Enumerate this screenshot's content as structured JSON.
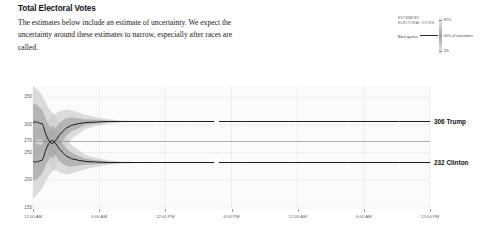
{
  "header": {
    "title": "Total Electoral Votes",
    "description": "The estimates below include an estimate of uncertainty. We expect the uncertainty around these estimates to narrow, especially after races are called."
  },
  "legend": {
    "title": "ESTIMATED ELECTORAL VOTES",
    "best_guess_label": "Best guess",
    "ticks": {
      "high": "95%",
      "middle": "50% of outcomes",
      "low": "5%"
    }
  },
  "annotations": {
    "trump": "306 Trump",
    "clinton": "232 Clinton"
  },
  "chart_data": {
    "type": "line",
    "title": "Total Electoral Votes",
    "xlabel": "",
    "ylabel": "Electoral votes",
    "ylim": [
      150,
      370
    ],
    "yticks": [
      350,
      300,
      270,
      250,
      200,
      150
    ],
    "ytick_labels": [
      "350",
      "300",
      "270",
      "250",
      "200",
      "150"
    ],
    "xticks": [
      "12:00 AM",
      "6:00 AM",
      "12:00 PM",
      "6:00 PM",
      "12:00 AM",
      "6:00 AM",
      "12:00 PM"
    ],
    "grid": true,
    "threshold": 270,
    "threshold_label": "270 to win",
    "legend_position": "top-right",
    "colors": {
      "line": "#1c1c1c",
      "band_inner": "#a9a9a9",
      "band_outer": "#cfcfcf",
      "threshold_line": "#8f8f8f",
      "grid": "#e8e8e8"
    },
    "series": [
      {
        "name": "306 Trump",
        "final_value": 306,
        "x": [
          0,
          2,
          4,
          6,
          8,
          10,
          12,
          14,
          16,
          18,
          20,
          22,
          24,
          26,
          28,
          30,
          34,
          38,
          44,
          52,
          60,
          72,
          86,
          100,
          140,
          180,
          240,
          300,
          360,
          420,
          455
        ],
        "values": [
          303,
          306,
          304,
          305,
          302,
          303,
          297,
          286,
          278,
          272,
          268,
          266,
          268,
          272,
          276,
          281,
          288,
          294,
          299,
          302,
          304,
          305,
          306,
          306,
          306,
          306,
          306,
          306,
          306,
          306,
          306
        ],
        "band95_hi": [
          370,
          368,
          364,
          362,
          358,
          354,
          348,
          342,
          336,
          330,
          326,
          322,
          320,
          320,
          322,
          324,
          326,
          327,
          326,
          322,
          318,
          314,
          310,
          308,
          306,
          306,
          306,
          306,
          306,
          306,
          306
        ],
        "band95_lo": [
          236,
          240,
          244,
          246,
          248,
          250,
          248,
          242,
          236,
          230,
          224,
          220,
          220,
          224,
          230,
          238,
          250,
          262,
          274,
          284,
          292,
          298,
          302,
          304,
          306,
          306,
          306,
          306,
          306,
          306,
          306
        ],
        "band50_hi": [
          338,
          338,
          336,
          334,
          330,
          328,
          322,
          314,
          306,
          300,
          294,
          290,
          290,
          294,
          298,
          303,
          308,
          312,
          313,
          312,
          310,
          309,
          308,
          307,
          306,
          306,
          306,
          306,
          306,
          306,
          306
        ],
        "band50_lo": [
          268,
          270,
          272,
          274,
          274,
          274,
          270,
          262,
          254,
          248,
          242,
          240,
          242,
          248,
          256,
          264,
          272,
          280,
          288,
          294,
          299,
          302,
          304,
          305,
          306,
          306,
          306,
          306,
          306,
          306,
          306
        ]
      },
      {
        "name": "232 Clinton",
        "final_value": 232,
        "x": [
          0,
          2,
          4,
          6,
          8,
          10,
          12,
          14,
          16,
          18,
          20,
          22,
          24,
          26,
          28,
          30,
          34,
          38,
          44,
          52,
          60,
          72,
          86,
          100,
          140,
          180,
          240,
          300,
          360,
          420,
          455
        ],
        "values": [
          235,
          232,
          234,
          233,
          236,
          235,
          241,
          252,
          260,
          266,
          270,
          272,
          270,
          266,
          262,
          257,
          250,
          244,
          239,
          236,
          234,
          233,
          232,
          232,
          232,
          232,
          232,
          232,
          232,
          232,
          232
        ],
        "band95_hi": [
          302,
          298,
          294,
          292,
          290,
          288,
          290,
          296,
          302,
          308,
          314,
          318,
          318,
          314,
          308,
          300,
          288,
          276,
          264,
          254,
          246,
          240,
          236,
          234,
          232,
          232,
          232,
          232,
          232,
          232,
          232
        ],
        "band95_lo": [
          168,
          170,
          174,
          176,
          180,
          184,
          190,
          196,
          202,
          208,
          212,
          216,
          218,
          218,
          216,
          214,
          212,
          211,
          212,
          216,
          220,
          224,
          228,
          230,
          232,
          232,
          232,
          232,
          232,
          232,
          232
        ],
        "band50_hi": [
          270,
          268,
          266,
          264,
          264,
          264,
          268,
          276,
          284,
          290,
          296,
          298,
          296,
          290,
          282,
          274,
          266,
          258,
          250,
          244,
          239,
          236,
          234,
          233,
          232,
          232,
          232,
          232,
          232,
          232,
          232
        ],
        "band50_lo": [
          200,
          200,
          202,
          204,
          208,
          210,
          216,
          224,
          232,
          238,
          244,
          248,
          248,
          244,
          240,
          235,
          230,
          226,
          225,
          226,
          228,
          229,
          230,
          231,
          232,
          232,
          232,
          232,
          232,
          232,
          232
        ]
      }
    ]
  }
}
